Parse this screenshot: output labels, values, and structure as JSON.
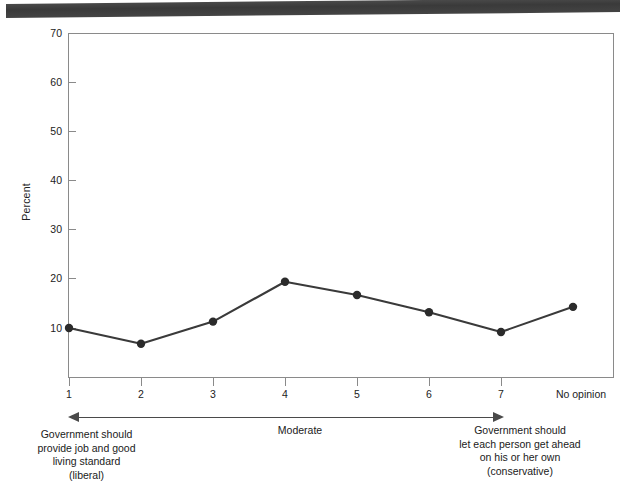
{
  "chart_data": {
    "type": "line",
    "title": "",
    "xlabel": "",
    "ylabel": "Percent",
    "categories": [
      "1",
      "2",
      "3",
      "4",
      "5",
      "6",
      "7",
      "No opinion"
    ],
    "values": [
      10.0,
      6.8,
      11.3,
      19.4,
      16.7,
      13.2,
      9.2,
      14.3
    ],
    "ylim": [
      0,
      70
    ],
    "yticks": [
      10,
      20,
      30,
      40,
      50,
      60,
      70
    ],
    "ytick_labels": [
      "10",
      "20",
      "30",
      "40",
      "50",
      "60",
      "70"
    ],
    "grid": false,
    "legend": "none",
    "marker": "filled-circle",
    "line_color": "#3a3a3a",
    "marker_color": "#2b2b2b",
    "axis_color": "#8a8a8a"
  },
  "axis": {
    "y_title": "Percent",
    "y_labels": [
      "70",
      "60",
      "50",
      "40",
      "30",
      "20",
      "10"
    ],
    "x_labels": [
      "1",
      "2",
      "3",
      "4",
      "5",
      "6",
      "7",
      "No opinion"
    ]
  },
  "annotations": {
    "scale_arrow": "double-headed-arrow",
    "left_caption": "Government should\nprovide job and good\nliving standard\n(liberal)",
    "middle_caption": "Moderate",
    "right_caption": "Government should\nlet each person get ahead\non his or her own\n(conservative)"
  },
  "artifacts": {
    "top_band": "scan-shadow-band"
  }
}
